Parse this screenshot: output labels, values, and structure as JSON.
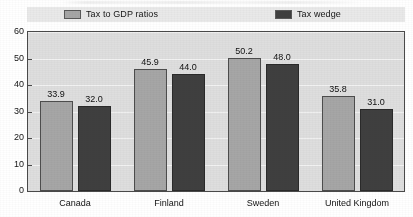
{
  "chart_data": {
    "type": "bar",
    "title": "",
    "subtitle": "",
    "xlabel": "",
    "ylabel": "",
    "categories": [
      "Canada",
      "Finland",
      "Sweden",
      "United Kingdom"
    ],
    "series": [
      {
        "name": "Tax to GDP ratios",
        "color": "#a6a6a6",
        "values": [
          33.9,
          45.9,
          50.2,
          35.8
        ],
        "labels": [
          "33.9",
          "45.9",
          "50.2",
          "35.8"
        ]
      },
      {
        "name": "Tax wedge",
        "color": "#3f3f3f",
        "values": [
          32.0,
          44.0,
          48.0,
          31.0
        ],
        "labels": [
          "32.0",
          "44.0",
          "48.0",
          "31.0"
        ]
      }
    ],
    "ylim": [
      0,
      60
    ],
    "yticks": [
      0,
      10,
      20,
      30,
      40,
      50,
      60
    ],
    "ytick_labels": [
      "0",
      "10",
      "20",
      "30",
      "40",
      "50",
      "60"
    ],
    "grid": true,
    "legend_position": "top",
    "plot_background": "#dedede",
    "axis_color": "#4a4a4a"
  },
  "legend": {
    "entries": [
      {
        "label": "Tax to GDP ratios",
        "color": "#a6a6a6"
      },
      {
        "label": "Tax wedge",
        "color": "#3f3f3f"
      }
    ]
  }
}
